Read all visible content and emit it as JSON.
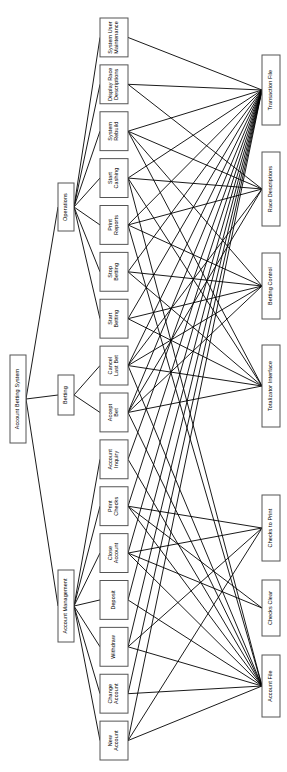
{
  "diagram": {
    "orientation": "rotated-90",
    "colors": {
      "background": "#ffffff",
      "box_stroke": "#555555",
      "box_fill": "#ffffff",
      "edge": "#000000",
      "text": "#000000"
    },
    "columns": {
      "root": "Account Betting System",
      "subsystems": [
        "Operations",
        "Betting",
        "Account Management"
      ],
      "processes": [
        "System User Maintenance",
        "Display Race Descriptions",
        "System Rebuild",
        "Start Cashing",
        "Print Reports",
        "Stop Betting",
        "Start Betting",
        "Cancel Last Bet",
        "Accept Bet",
        "Account Inquiry",
        "Print Checks",
        "Close Account",
        "Deposit",
        "Withdraw",
        "Change Account",
        "New Account"
      ],
      "datastores": [
        "Transaction File",
        "Race Descriptions",
        "Betting Control",
        "Totalizator Interface",
        "Checks to Print",
        "Checks Clear",
        "Account File"
      ]
    },
    "nodes": [
      {
        "id": "root",
        "label": "Account Betting System",
        "x": 10,
        "y": 355,
        "w": 16,
        "h": 88,
        "col": "root"
      },
      {
        "id": "ops",
        "label": "Operations",
        "x": 58,
        "y": 183,
        "w": 16,
        "h": 48,
        "col": "sub"
      },
      {
        "id": "bet",
        "label": "Betting",
        "x": 58,
        "y": 375,
        "w": 16,
        "h": 40,
        "col": "sub"
      },
      {
        "id": "acct",
        "label": "Account Management",
        "x": 58,
        "y": 570,
        "w": 16,
        "h": 72,
        "col": "sub"
      },
      {
        "id": "p01",
        "label": "System User Maintenance",
        "x": 100,
        "y": 18,
        "w": 28,
        "h": 58,
        "col": "proc"
      },
      {
        "id": "p02",
        "label": "Display Race Descriptions",
        "x": 100,
        "y": 88,
        "w": 28,
        "h": 58,
        "col": "proc"
      },
      {
        "id": "p03",
        "label": "System Rebuild",
        "x": 100,
        "y": 158,
        "w": 28,
        "h": 48,
        "col": "proc"
      },
      {
        "id": "p04",
        "label": "Start Cashing",
        "x": 100,
        "y": 218,
        "w": 28,
        "h": 44,
        "col": "proc"
      },
      {
        "id": "p05",
        "label": "Print Reports",
        "x": 100,
        "y": 274,
        "w": 28,
        "h": 44,
        "col": "proc"
      },
      {
        "id": "p06",
        "label": "Stop Betting",
        "x": 100,
        "y": 330,
        "w": 28,
        "h": 44,
        "col": "proc"
      },
      {
        "id": "p07",
        "label": "Start Betting",
        "x": 100,
        "y": 386,
        "w": 28,
        "h": 44,
        "col": "proc"
      },
      {
        "id": "p08",
        "label": "Cancel Last Bet",
        "x": 100,
        "y": 442,
        "w": 28,
        "h": 46,
        "col": "proc"
      },
      {
        "id": "p09",
        "label": "Accept Bet",
        "x": 100,
        "y": 500,
        "w": 28,
        "h": 42,
        "col": "proc"
      },
      {
        "id": "p10",
        "label": "Account Inquiry",
        "x": 100,
        "y": 554,
        "w": 28,
        "h": 48,
        "col": "proc"
      },
      {
        "id": "p11",
        "label": "Print Checks",
        "x": 100,
        "y": 614,
        "w": 28,
        "h": 42,
        "col": "proc"
      },
      {
        "id": "p12",
        "label": "Close Account",
        "x": 100,
        "y": 668,
        "w": 28,
        "h": 44,
        "col": "proc"
      },
      {
        "id": "p13",
        "label": "Deposit",
        "x": 100,
        "y": 724,
        "w": 28,
        "h": 36,
        "col": "proc"
      },
      {
        "id": "d1",
        "label": "Transaction File",
        "x": 262,
        "y": 55,
        "w": 18,
        "h": 70,
        "col": "data"
      },
      {
        "id": "d2",
        "label": "Race Descriptions",
        "x": 262,
        "y": 152,
        "w": 18,
        "h": 74,
        "col": "data"
      },
      {
        "id": "d3",
        "label": "Betting Control",
        "x": 262,
        "y": 253,
        "w": 18,
        "h": 66,
        "col": "data"
      },
      {
        "id": "d4",
        "label": "Totalizator Interface",
        "x": 262,
        "y": 345,
        "w": 18,
        "h": 82,
        "col": "data"
      },
      {
        "id": "d5",
        "label": "Checks to Print",
        "x": 262,
        "y": 495,
        "w": 18,
        "h": 66,
        "col": "data"
      },
      {
        "id": "d6",
        "label": "Checks Clear",
        "x": 262,
        "y": 580,
        "w": 18,
        "h": 56,
        "col": "data"
      },
      {
        "id": "d7",
        "label": "Account File",
        "x": 262,
        "y": 655,
        "w": 18,
        "h": 62,
        "col": "data"
      }
    ],
    "edge_count": 58
  }
}
